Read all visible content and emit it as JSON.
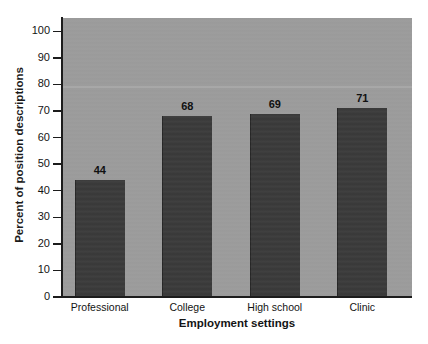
{
  "chart_data": {
    "type": "bar",
    "title": "",
    "subtitle": "",
    "xlabel": "Employment settings",
    "ylabel": "Percent of position descriptions",
    "categories": [
      "Professional",
      "College",
      "High school",
      "Clinic"
    ],
    "values": [
      44,
      68,
      69,
      71
    ],
    "data_labels": [
      "44",
      "68",
      "69",
      "71"
    ],
    "ylim": [
      0,
      105
    ],
    "yticks": [
      0,
      10,
      20,
      30,
      40,
      50,
      60,
      70,
      80,
      90,
      100
    ],
    "ytick_labels": [
      "0",
      "10",
      "20",
      "30",
      "40",
      "50",
      "60",
      "70",
      "80",
      "90",
      "100"
    ],
    "grid": false,
    "legend": null,
    "legend_position": "none",
    "annotations": []
  },
  "style": {
    "plot_background": "#9c9c9c",
    "bar_color": "#3b3b3b",
    "axis_color": "#1c1c1c",
    "text_color": "#141414",
    "page_background": "#ffffff"
  }
}
